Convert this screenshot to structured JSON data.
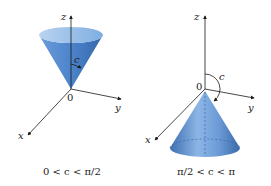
{
  "figures": [
    {
      "id": "left",
      "axes": {
        "z": "z",
        "y": "y",
        "x": "x",
        "origin": "0"
      },
      "angle_label": "c",
      "caption": "0 < c < π/2",
      "cone": "opens upward"
    },
    {
      "id": "right",
      "axes": {
        "z": "z",
        "y": "y",
        "x": "x",
        "origin": "0"
      },
      "angle_label": "c",
      "caption": "π/2 < c < π",
      "cone": "opens downward"
    }
  ],
  "colors": {
    "cone_light": "#a9c8ea",
    "cone_mid": "#5a8fd0",
    "cone_dark": "#2f5f9e",
    "axis": "#1a1a1a"
  }
}
